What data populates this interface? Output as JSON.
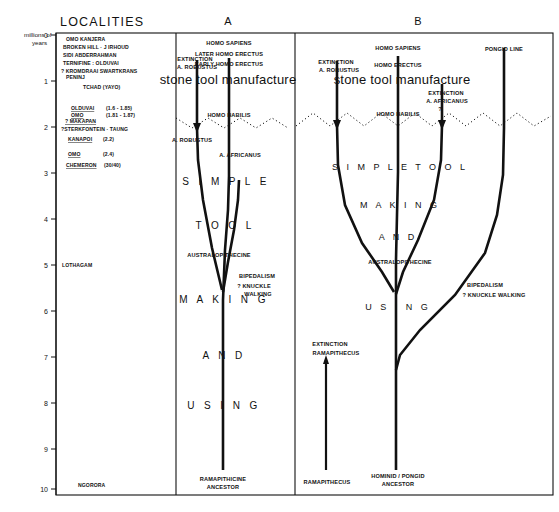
{
  "axis": {
    "caption_line1": "millions of",
    "caption_line2": "years",
    "ticks": [
      "0",
      "1",
      "2",
      "3",
      "4",
      "5",
      "6",
      "7",
      "8",
      "9",
      "10"
    ]
  },
  "header": {
    "localities_title": "LOCALITIES",
    "panel_a_letter": "A",
    "panel_b_letter": "B"
  },
  "localities": {
    "group1": [
      "OMO  KANJERA",
      "BROKEN HILL · J IRHOUD",
      "SIDI ABDERRAHMAN",
      "TERNIFINE : OLDUVAI",
      "? KROMDRAAI  SWARTKRANS",
      "PENINJ",
      "TCHAD (YAYO)"
    ],
    "group2": [
      {
        "name": "OLDUVAI",
        "range": "(1.6 - 1.85)"
      },
      {
        "name": "OMO",
        "range": "(1.81 - 1.87)"
      },
      {
        "name": "? MAKAPAN",
        "range": ""
      },
      {
        "name": "?STERKFONTEIN · TAUNG",
        "range": ""
      },
      {
        "name": "KANAPOI",
        "range": "(2.2)"
      },
      {
        "name": "OMO",
        "range": "(2.4)"
      },
      {
        "name": "CHEMERON",
        "range": "(30/40)"
      }
    ],
    "lothagam": "LOTHAGAM",
    "ngorora": "NGORORA"
  },
  "panel_a": {
    "labels": [
      "HOMO   SAPIENS",
      "LATER HOMO ERECTUS",
      "EARLY HOMO ERECTUS",
      "EXTINCTION",
      "A. ROBUSTUS",
      "HOMO HABILIS",
      "A. ROBUSTUS",
      "A. AFRICANUS",
      "AUSTRALOPITHECINE",
      "BIPEDALISM",
      "? KNUCKLE",
      "WALKING",
      "RAMAPITHICINE",
      "ANCESTOR"
    ],
    "banner": "stone tool manufacture",
    "band_words": [
      "S I M P L E",
      "T O O L",
      "M A K I N G",
      "A N D",
      "U S I N G"
    ]
  },
  "panel_b": {
    "labels": [
      "HOMO  SAPIENS",
      "HOMO ERECTUS",
      "PONGID  LINE",
      "EXTINCTION",
      "A.  ROBUSTUS",
      "EXTINCTION",
      "A. AFRICANUS",
      "?",
      "HOMO HABILIS",
      "AUSTRALOPITHECINE",
      "BIPEDALISM",
      "? KNUCKLE  WALKING",
      "EXTINCTION",
      "RAMAPITHECUS",
      "RAMAPITHECUS",
      "HOMINID / PONGID",
      "ANCESTOR"
    ],
    "banner": "stone tool manufacture",
    "band_words": [
      "S I M P L E   T O O L",
      "M A K I N G",
      "A N D",
      "U S I N G"
    ]
  },
  "colors": {
    "ink": "#111111",
    "paper": "#ffffff"
  }
}
